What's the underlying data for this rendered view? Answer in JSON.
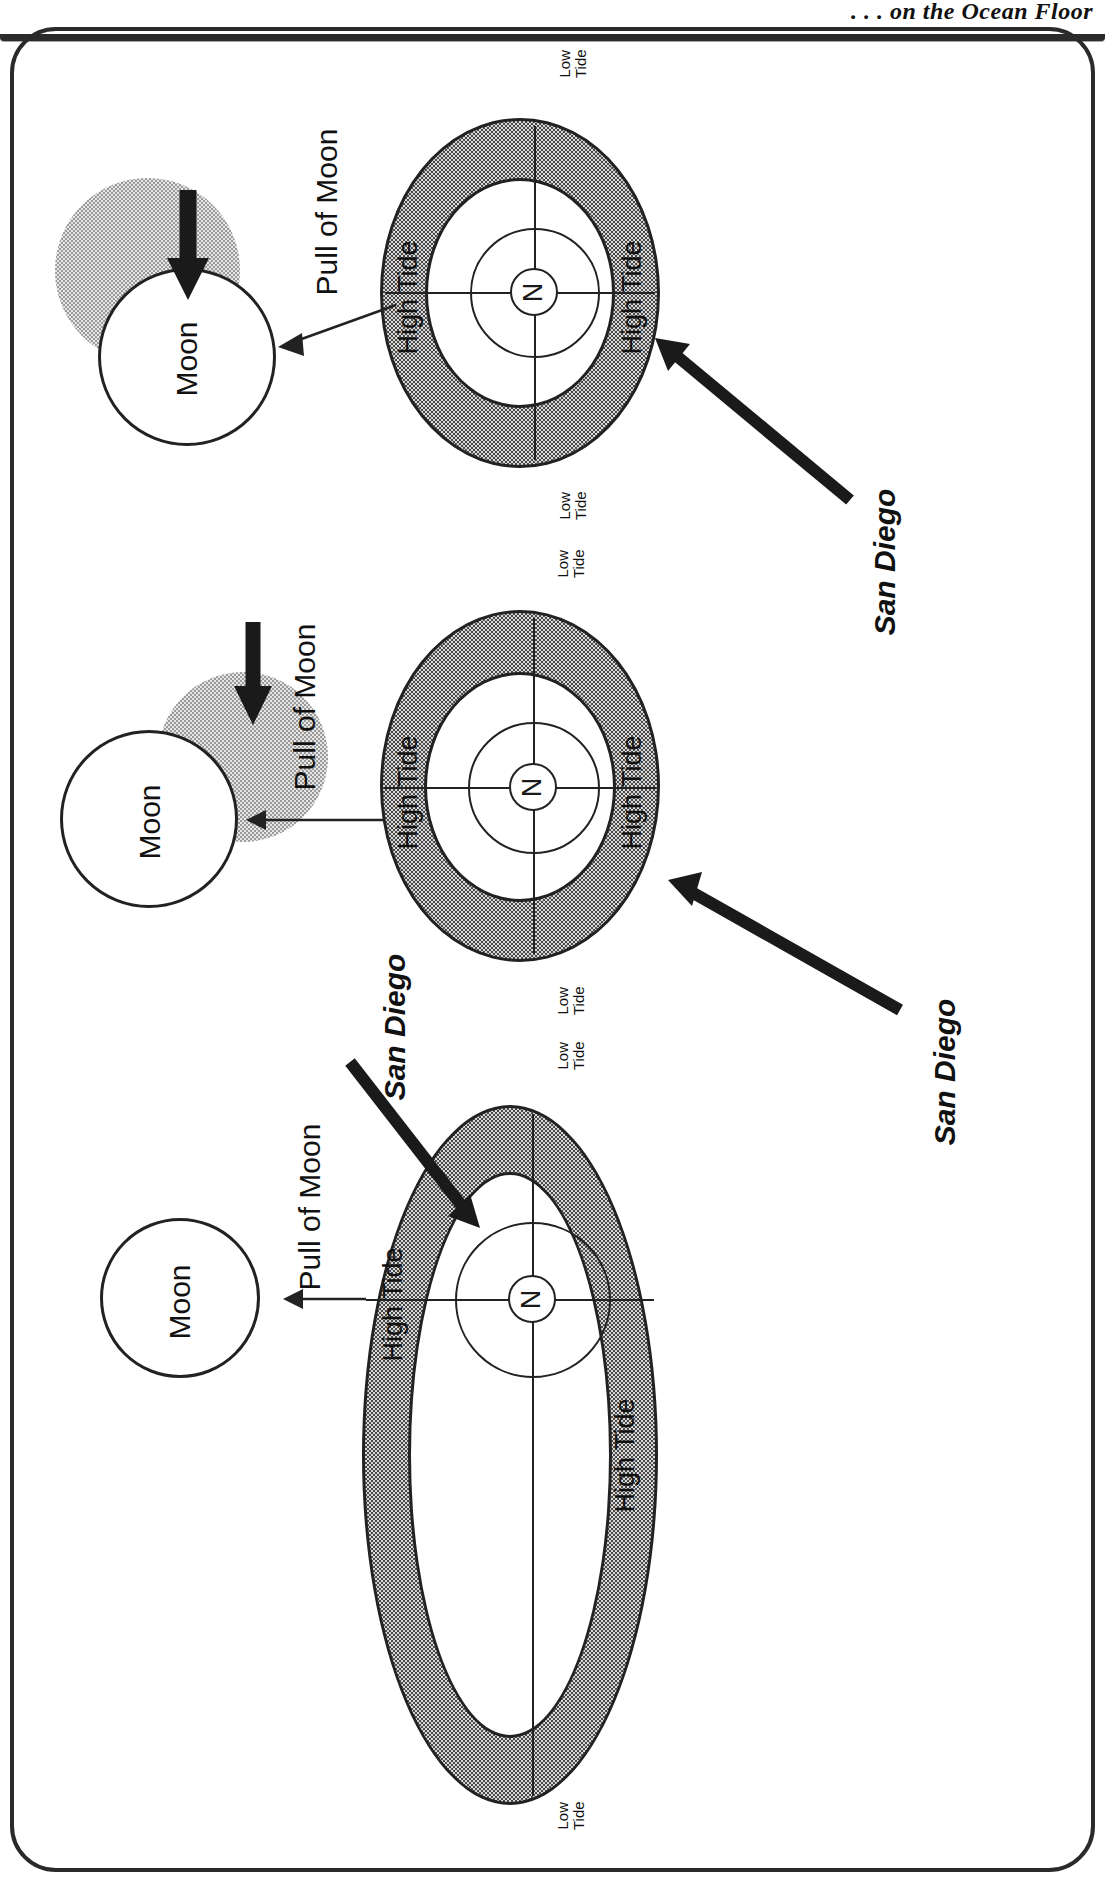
{
  "header": {
    "title": ". . . on the Ocean Floor"
  },
  "figure": {
    "orientation": "rotated-90-ccw",
    "frame": "rounded-rectangle-border",
    "colors": {
      "ink": "#222222",
      "tide_band_fill": "#8a8a8a",
      "moon_shadow_fill": "#b9b9b9",
      "paper": "#ffffff"
    }
  },
  "panels": [
    {
      "id": "panel-top",
      "moon_label": "Moon",
      "has_moon_shadow": true,
      "moon_motion_arrow": true,
      "pull_label": "Pull of Moon",
      "high_tide_left": "High Tide",
      "high_tide_right": "High Tide",
      "low_tide_top": "Low\nTide",
      "low_tide_bottom": "Low\nTide",
      "pole_label": "N",
      "san_diego_label": "San Diego",
      "san_diego_position": "lower-right-quadrant"
    },
    {
      "id": "panel-middle",
      "moon_label": "Moon",
      "has_moon_shadow": true,
      "moon_motion_arrow": true,
      "pull_label": "Pull of Moon",
      "high_tide_left": "High Tide",
      "high_tide_right": "High Tide",
      "low_tide_top": "Low\nTide",
      "low_tide_bottom": "Low\nTide",
      "pole_label": "N",
      "san_diego_label": "San Diego",
      "san_diego_position": "right-equator"
    },
    {
      "id": "panel-bottom",
      "moon_label": "Moon",
      "has_moon_shadow": false,
      "moon_motion_arrow": false,
      "pull_label": "Pull of Moon",
      "high_tide_left": "High Tide",
      "high_tide_right": "High Tide",
      "low_tide_top": "Low\nTide",
      "low_tide_bottom": "Low\nTide",
      "pole_label": "N",
      "san_diego_label": "San Diego",
      "san_diego_position": "upper-left-quadrant"
    }
  ],
  "labels": {
    "low_tide_line1": "Low",
    "low_tide_line2": "Tide",
    "high_tide": "High Tide",
    "moon": "Moon",
    "pull_of_moon": "Pull of Moon",
    "san_diego": "San Diego",
    "north_pole": "N"
  }
}
